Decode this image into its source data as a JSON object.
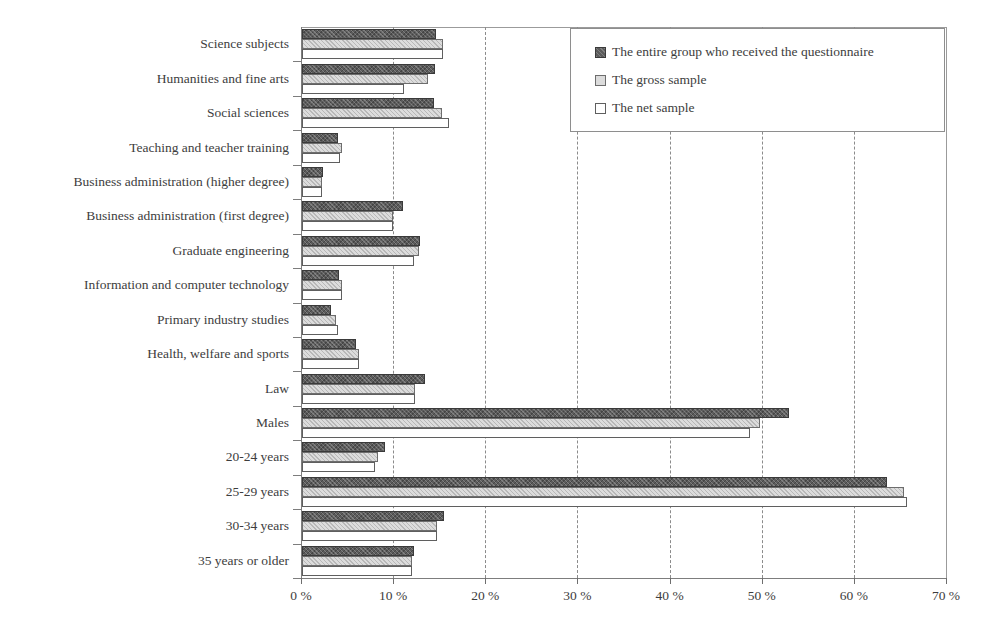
{
  "chart_data": {
    "type": "bar",
    "orientation": "horizontal",
    "title": "",
    "xlabel": "",
    "ylabel": "",
    "xlim": [
      0,
      70
    ],
    "xticks": [
      0,
      10,
      20,
      30,
      40,
      50,
      60,
      70
    ],
    "xtick_labels": [
      "0 %",
      "10 %",
      "20 %",
      "30 %",
      "40 %",
      "50 %",
      "60 %",
      "70 %"
    ],
    "grid": "vertical-dashed",
    "legend_position": "top-right",
    "categories": [
      "Science subjects",
      "Humanities and fine arts",
      "Social sciences",
      "Teaching and teacher training",
      "Business administration (higher degree)",
      "Business administration (first degree)",
      "Graduate engineering",
      "Information and computer technology",
      "Primary industry studies",
      "Health, welfare and sports",
      "Law",
      "Males",
      "20-24 years",
      "25-29 years",
      "30-34 years",
      "35 years or older"
    ],
    "series": [
      {
        "name": "The entire group who received the questionnaire",
        "color": "#5c5c5c",
        "values": [
          14.5,
          14.4,
          14.3,
          3.9,
          2.3,
          11.0,
          12.8,
          4.0,
          3.1,
          5.9,
          13.3,
          52.8,
          9.0,
          63.5,
          15.4,
          12.2
        ]
      },
      {
        "name": "The gross sample",
        "color": "#dcdcdc",
        "values": [
          15.3,
          13.7,
          15.2,
          4.3,
          2.2,
          9.9,
          12.7,
          4.3,
          3.7,
          6.2,
          12.3,
          49.7,
          8.3,
          65.3,
          14.7,
          11.9
        ]
      },
      {
        "name": "The net sample",
        "color": "#ffffff",
        "values": [
          15.3,
          11.1,
          16.0,
          4.1,
          2.2,
          9.9,
          12.2,
          4.3,
          3.9,
          6.2,
          12.3,
          48.6,
          7.9,
          65.7,
          14.7,
          11.9
        ]
      }
    ]
  },
  "legend": {
    "items": [
      {
        "label": "The entire group who received the questionnaire"
      },
      {
        "label": "The gross sample"
      },
      {
        "label": "The net sample"
      }
    ]
  }
}
